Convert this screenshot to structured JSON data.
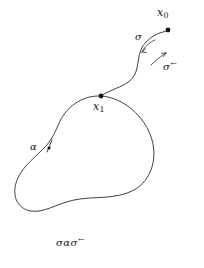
{
  "figure": {
    "kind": "topology-homotopy-diagram",
    "background_color": "#ffffff",
    "stroke_color": "#2a2a2a",
    "text_color": "#151515",
    "width": 204,
    "height": 268
  },
  "labels": {
    "basepoint_outer": "x",
    "basepoint_outer_sub": "0",
    "basepoint_inner": "x",
    "basepoint_inner_sub": "1",
    "path_forward": "σ",
    "path_reverse": "σ",
    "path_reverse_arrow": "←",
    "loop": "α"
  },
  "caption": {
    "sigma": "σ",
    "alpha": "α",
    "sigma_rev": "σ",
    "sigma_rev_arrow": "←",
    "full_text": "σασ←"
  },
  "points": [
    {
      "name": "x0",
      "x": 168,
      "y": 30,
      "radius": 2.4
    },
    {
      "name": "x1",
      "x": 101,
      "y": 96,
      "radius": 2.4
    },
    {
      "name": "alpha-marker",
      "x": 49,
      "y": 148,
      "radius": 1.6
    }
  ],
  "geometry": {
    "loop_path": "M 101 96 C 120 97 141 112 150 134 C 159 156 152 180 134 190 C 116 200 92 196 74 200 C 56 204 44 213 31 211 C 18 209 12 197 16 183 C 20 169 33 159 42 150 C 52 141 56 130 60 121 C 66 109 80 95 101 96 Z",
    "sigma_path": "M 101 96 C 113 88 128 86 134 76 C 140 66 136 52 146 42 C 154 34 162 32 167 31",
    "arrow_forward_arc": "M 155 40 C 150 42 145 46 142 52",
    "arrow_reverse_arc": "M 151 65 C 156 60 161 56 166 53",
    "alpha_tick": "M 52 140 L 47 152"
  },
  "arrowheads": {
    "forward_tip": {
      "x": 142,
      "y": 52,
      "angle_deg": 118
    },
    "reverse_tip": {
      "x": 166,
      "y": 53,
      "angle_deg": -40
    }
  }
}
